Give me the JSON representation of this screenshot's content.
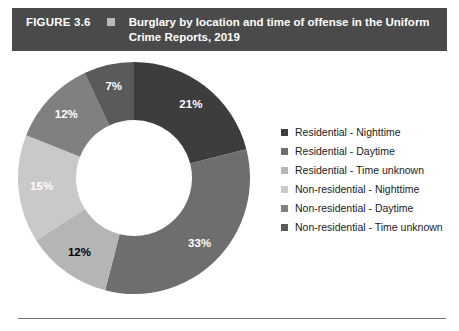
{
  "banner": {
    "figure_number": "FIGURE 3.6",
    "bullet_icon": "square-bullet-icon",
    "title": "Burglary by location and time of offense in the Uniform Crime Reports, 2019"
  },
  "chart_data": {
    "type": "pie",
    "variant": "donut",
    "title": "Burglary by location and time of offense in the Uniform Crime Reports, 2019",
    "categories": [
      "Residential - Nighttime",
      "Residential - Daytime",
      "Residential - Time unknown",
      "Non-residential - Nighttime",
      "Non-residential - Daytime",
      "Non-residential - Time unknown"
    ],
    "values": [
      21,
      33,
      12,
      15,
      12,
      7
    ],
    "value_labels": [
      "21%",
      "33%",
      "12%",
      "15%",
      "12%",
      "7%"
    ],
    "colors": [
      "#3d3d3d",
      "#6e6e6e",
      "#b5b5b5",
      "#c9c9c9",
      "#808080",
      "#5a5a5a"
    ],
    "label_colors": [
      "#ffffff",
      "#ffffff",
      "#000000",
      "#ffffff",
      "#ffffff",
      "#ffffff"
    ],
    "units": "percent",
    "start_angle_deg": 0,
    "direction": "clockwise",
    "inner_radius_ratio": 0.5,
    "legend_position": "right",
    "grid": false,
    "xlabel": "",
    "ylabel": ""
  },
  "legend": {
    "items": [
      {
        "label": "Residential - Nighttime",
        "color": "#3d3d3d"
      },
      {
        "label": "Residential - Daytime",
        "color": "#6e6e6e"
      },
      {
        "label": "Residential - Time unknown",
        "color": "#b5b5b5"
      },
      {
        "label": "Non-residential - Nighttime",
        "color": "#c9c9c9"
      },
      {
        "label": "Non-residential - Daytime",
        "color": "#808080"
      },
      {
        "label": "Non-residential - Time unknown",
        "color": "#5a5a5a"
      }
    ]
  }
}
